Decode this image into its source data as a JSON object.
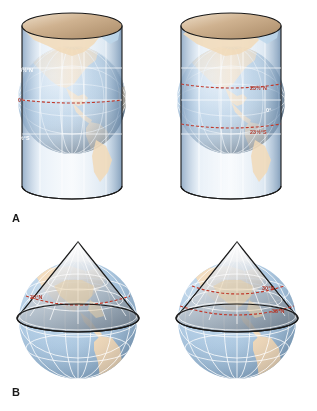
{
  "figure": {
    "title_caption": "",
    "panels": [
      {
        "id": "A",
        "letter": "A",
        "name": "cylindrical-projections",
        "items": [
          {
            "name": "tangent-cylinder",
            "labels": [
              {
                "text": "23½°N",
                "color": "#ffffff"
              },
              {
                "text": "0°",
                "color": "#b03a2e"
              },
              {
                "text": "23½°S",
                "color": "#ffffff"
              }
            ]
          },
          {
            "name": "secant-cylinder",
            "labels": [
              {
                "text": "23½°N",
                "color": "#b03a2e"
              },
              {
                "text": "0°",
                "color": "#ffffff"
              },
              {
                "text": "23½°S",
                "color": "#b03a2e"
              }
            ]
          }
        ]
      },
      {
        "id": "B",
        "letter": "B",
        "name": "conic-projections",
        "items": [
          {
            "name": "tangent-cone",
            "labels": [
              {
                "text": "30°N",
                "color": "#b03a2e"
              }
            ]
          },
          {
            "name": "secant-cone",
            "labels": [
              {
                "text": "30°N",
                "color": "#b03a2e"
              },
              {
                "text": "38°N",
                "color": "#b03a2e"
              }
            ]
          }
        ]
      }
    ],
    "colors": {
      "background": "#ffffff",
      "ocean": "#a9c3dd",
      "land": "#f2d9b8",
      "globe_shadow": "#4b5560",
      "surface_glass": "#b3c9e0",
      "cylinder_top": "#c9a882",
      "cone_fill": "#c9ccd1",
      "outline": "#1a1a1a",
      "graticule": "#ffffff",
      "tropic_line": "#c0392b",
      "letter": "#1a1a1a"
    }
  }
}
